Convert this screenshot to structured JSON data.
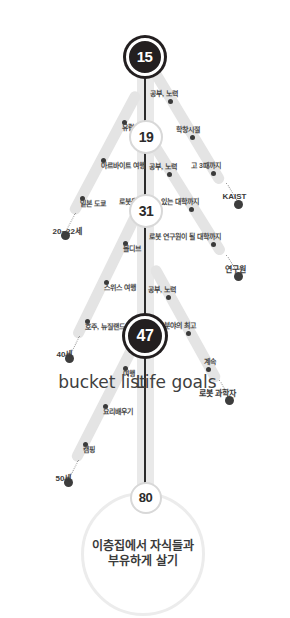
{
  "diagram": {
    "title_bubble": "이층집에서 자식들과 부유하게 살기",
    "side_label_left": "Life goals",
    "side_label_right": "bucket list",
    "milestones": [
      {
        "value": "15",
        "style": "dark"
      },
      {
        "value": "19",
        "style": "light"
      },
      {
        "value": "31",
        "style": "light"
      },
      {
        "value": "47",
        "style": "dark"
      },
      {
        "value": "80",
        "style": "light"
      }
    ],
    "life_goal_branches": [
      {
        "endpoint_label": "KAIST",
        "steps": [
          "공부, 노력",
          "학창시절",
          "고 3때까지"
        ]
      },
      {
        "endpoint_label": "연구원",
        "steps": [
          "공부, 노력",
          "로봇을 만들 수 있는 대학까지",
          "로봇 연구원이 될 대학까지"
        ]
      },
      {
        "endpoint_label": "로봇 과학자",
        "steps": [
          "공부, 노력",
          "그 분야의 최고",
          "계속"
        ]
      }
    ],
    "bucket_list_branches": [
      {
        "endpoint_label": "20~22세",
        "steps": [
          "유럽여행",
          "아르바이트 여행",
          "일본 도쿄"
        ]
      },
      {
        "endpoint_label": "40세",
        "steps": [
          "몰디브",
          "스위스 여행",
          "호주, 뉴질랜드"
        ]
      },
      {
        "endpoint_label": "50세",
        "steps": [
          "여행",
          "요리배우기",
          "캠핑"
        ]
      }
    ],
    "colors": {
      "road": "#e9e9e9",
      "branch": "#e4e4e4",
      "node_dark": "#231f20",
      "node_light": "#ffffff",
      "text": "#4a4a4a",
      "background": "#ffffff"
    }
  }
}
